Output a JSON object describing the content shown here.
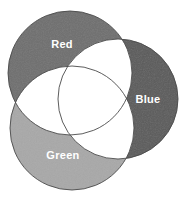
{
  "figure": {
    "type": "venn-diagram",
    "background_color": "#ffffff",
    "overlap_fill_color": "#ffffff",
    "outline_color": "#4a4a4a",
    "label_color": "#ffffff"
  },
  "chart_data": {
    "type": "venn",
    "title": "",
    "sets": [
      {
        "id": "red",
        "label": "Red",
        "color": "#6e6e6e",
        "cx": 70,
        "cy": 73,
        "r": 62,
        "label_x": 62,
        "label_y": 45
      },
      {
        "id": "blue",
        "label": "Blue",
        "color": "#5a5a5a",
        "cx": 118,
        "cy": 99,
        "r": 60,
        "label_x": 148,
        "label_y": 100
      },
      {
        "id": "green",
        "label": "Green",
        "color": "#a8a8a8",
        "cx": 72,
        "cy": 128,
        "r": 62,
        "label_x": 63,
        "label_y": 156
      }
    ],
    "regions": [
      {
        "id": "red-only",
        "label": "Red",
        "fill": "#6e6e6e"
      },
      {
        "id": "blue-only",
        "label": "Blue",
        "fill": "#5a5a5a"
      },
      {
        "id": "green-only",
        "label": "Green",
        "fill": "#a8a8a8"
      },
      {
        "id": "red-blue",
        "label": "",
        "fill": "#ffffff"
      },
      {
        "id": "red-green",
        "label": "",
        "fill": "#ffffff"
      },
      {
        "id": "green-blue",
        "label": "",
        "fill": "#ffffff"
      },
      {
        "id": "red-green-blue",
        "label": "",
        "fill": "#ffffff"
      }
    ],
    "legend": "none",
    "grid": false
  }
}
